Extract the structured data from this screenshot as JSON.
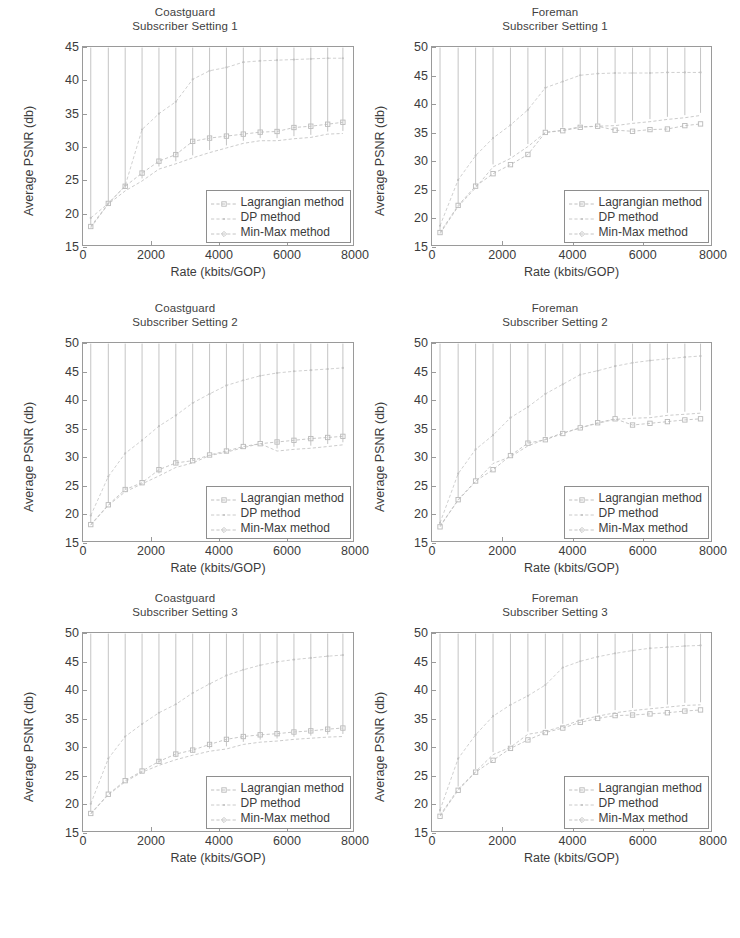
{
  "figure": {
    "background": "#ffffff",
    "series_colors": [
      "#b9b9b9",
      "#c4c4c4",
      "#bdbdbd"
    ],
    "axis_color": "#9a9a9a",
    "text_color": "#3c3c3c"
  },
  "axis": {
    "xlabel": "Rate (kbits/GOP)",
    "ylabel": "Average PSNR (db)",
    "xticks": [
      "0",
      "2000",
      "4000",
      "6000",
      "8000"
    ],
    "xtick_values": [
      0,
      2000,
      4000,
      6000,
      8000
    ],
    "xlim": [
      0,
      8000
    ],
    "yticks_45": [
      "15",
      "20",
      "25",
      "30",
      "35",
      "40",
      "45"
    ],
    "ytick_values_45": [
      15,
      20,
      25,
      30,
      35,
      40,
      45
    ],
    "ylim_45": [
      15,
      45
    ],
    "yticks_50": [
      "15",
      "20",
      "25",
      "30",
      "35",
      "40",
      "45",
      "50"
    ],
    "ytick_values_50": [
      15,
      20,
      25,
      30,
      35,
      40,
      45,
      50
    ],
    "ylim_50": [
      15,
      50
    ]
  },
  "legend": {
    "entries": [
      {
        "label": "Lagrangian method",
        "marker": "square-marker"
      },
      {
        "label": "DP method",
        "marker": "dot-marker"
      },
      {
        "label": "Min-Max method",
        "marker": "diamond-marker"
      }
    ]
  },
  "chart_data": [
    {
      "id": "coastguard-setting-1",
      "type": "line",
      "title": "Coastguard\nSubscriber Setting 1",
      "title_line1": "Coastguard",
      "title_line2": "Subscriber Setting 1",
      "xlabel": "Rate (kbits/GOP)",
      "ylabel": "Average PSNR (db)",
      "xlim": [
        0,
        8000
      ],
      "ylim": [
        15,
        45
      ],
      "grid": false,
      "legend_position": "lower-right",
      "x": [
        230,
        750,
        1250,
        1750,
        2250,
        2750,
        3250,
        3750,
        4250,
        4750,
        5250,
        5750,
        6250,
        6750,
        7250,
        7700
      ],
      "series": [
        {
          "name": "Lagrangian method",
          "values": [
            17.8,
            21.3,
            23.9,
            25.9,
            27.7,
            28.7,
            30.7,
            31.2,
            31.5,
            31.8,
            32.1,
            32.2,
            32.8,
            33.0,
            33.3,
            33.6
          ]
        },
        {
          "name": "DP method",
          "values": [
            19.1,
            21.3,
            24.0,
            32.5,
            34.9,
            36.7,
            40.1,
            41.4,
            41.9,
            42.7,
            42.9,
            43.0,
            43.1,
            43.2,
            43.3,
            43.3
          ]
        },
        {
          "name": "Min-Max method",
          "values": [
            17.6,
            21.2,
            23.2,
            24.7,
            26.5,
            27.3,
            28.2,
            29.0,
            29.7,
            30.4,
            30.8,
            30.8,
            31.1,
            31.3,
            31.8,
            31.9
          ]
        }
      ]
    },
    {
      "id": "foreman-setting-1",
      "type": "line",
      "title": "Foreman\nSubscriber Setting 1",
      "title_line1": "Foreman",
      "title_line2": "Subscriber Setting 1",
      "xlabel": "Rate (kbits/GOP)",
      "ylabel": "Average PSNR (db)",
      "xlim": [
        0,
        8000
      ],
      "ylim": [
        15,
        50
      ],
      "grid": false,
      "legend_position": "lower-right",
      "x": [
        230,
        750,
        1250,
        1750,
        2250,
        2750,
        3250,
        3750,
        4250,
        4750,
        5250,
        5750,
        6250,
        6750,
        7250,
        7700
      ],
      "series": [
        {
          "name": "Lagrangian method",
          "values": [
            17.2,
            22.0,
            25.4,
            27.6,
            29.2,
            31.0,
            34.9,
            35.2,
            35.8,
            36.0,
            35.3,
            35.1,
            35.4,
            35.5,
            36.1,
            36.4
          ]
        },
        {
          "name": "DP method",
          "values": [
            18.4,
            26.5,
            30.8,
            33.9,
            36.2,
            38.9,
            42.8,
            43.9,
            45.0,
            45.3,
            45.4,
            45.4,
            45.4,
            45.5,
            45.5,
            45.5
          ]
        },
        {
          "name": "Min-Max method",
          "values": [
            17.0,
            21.8,
            25.1,
            28.8,
            30.3,
            32.4,
            34.9,
            35.3,
            35.9,
            36.0,
            36.1,
            36.5,
            36.8,
            37.2,
            37.5,
            37.9
          ]
        }
      ]
    },
    {
      "id": "coastguard-setting-2",
      "type": "line",
      "title": "Coastguard\nSubscriber Setting 2",
      "title_line1": "Coastguard",
      "title_line2": "Subscriber Setting 2",
      "xlabel": "Rate (kbits/GOP)",
      "ylabel": "Average PSNR (db)",
      "xlim": [
        0,
        8000
      ],
      "ylim": [
        15,
        50
      ],
      "grid": false,
      "legend_position": "lower-right",
      "x": [
        230,
        750,
        1250,
        1750,
        2250,
        2750,
        3250,
        3750,
        4250,
        4750,
        5250,
        5750,
        6250,
        6750,
        7250,
        7700
      ],
      "series": [
        {
          "name": "Lagrangian method",
          "values": [
            17.9,
            21.4,
            24.1,
            25.3,
            27.6,
            28.8,
            29.2,
            30.2,
            30.9,
            31.7,
            32.2,
            32.5,
            32.8,
            33.1,
            33.3,
            33.5
          ]
        },
        {
          "name": "DP method",
          "values": [
            19.5,
            26.4,
            30.5,
            32.8,
            35.3,
            37.2,
            39.4,
            41.0,
            42.5,
            43.4,
            44.2,
            44.7,
            45.0,
            45.2,
            45.4,
            45.6
          ]
        },
        {
          "name": "Min-Max method",
          "values": [
            17.8,
            21.3,
            23.7,
            25.1,
            26.5,
            28.0,
            28.8,
            30.1,
            30.7,
            31.5,
            32.2,
            30.9,
            31.2,
            31.4,
            31.7,
            32.0
          ]
        }
      ]
    },
    {
      "id": "foreman-setting-2",
      "type": "line",
      "title": "Foreman\nSubscriber Setting 2",
      "title_line1": "Foreman",
      "title_line2": "Subscriber Setting 2",
      "xlabel": "Rate (kbits/GOP)",
      "ylabel": "Average PSNR (db)",
      "xlim": [
        0,
        8000
      ],
      "ylim": [
        15,
        50
      ],
      "grid": false,
      "legend_position": "lower-right",
      "x": [
        230,
        750,
        1250,
        1750,
        2250,
        2750,
        3250,
        3750,
        4250,
        4750,
        5250,
        5750,
        6250,
        6750,
        7250,
        7700
      ],
      "series": [
        {
          "name": "Lagrangian method",
          "values": [
            17.5,
            22.3,
            25.6,
            27.6,
            30.1,
            32.3,
            32.9,
            34.0,
            35.0,
            35.9,
            36.6,
            35.5,
            35.8,
            36.1,
            36.4,
            36.6
          ]
        },
        {
          "name": "DP method",
          "values": [
            18.2,
            26.9,
            31.2,
            33.7,
            36.8,
            38.7,
            41.0,
            42.7,
            44.4,
            45.1,
            45.9,
            46.5,
            46.9,
            47.2,
            47.5,
            47.7
          ]
        },
        {
          "name": "Min-Max method",
          "values": [
            17.7,
            22.2,
            25.5,
            28.7,
            29.9,
            31.8,
            33.0,
            34.1,
            35.0,
            35.8,
            36.5,
            36.7,
            36.8,
            37.2,
            37.4,
            37.6
          ]
        }
      ]
    },
    {
      "id": "coastguard-setting-3",
      "type": "line",
      "title": "Coastguard\nSubscriber Setting 3",
      "title_line1": "Coastguard",
      "title_line2": "Subscriber Setting 3",
      "xlabel": "Rate (kbits/GOP)",
      "ylabel": "Average PSNR (db)",
      "xlim": [
        0,
        8000
      ],
      "ylim": [
        15,
        50
      ],
      "grid": false,
      "legend_position": "lower-right",
      "x": [
        230,
        750,
        1250,
        1750,
        2250,
        2750,
        3250,
        3750,
        4250,
        4750,
        5250,
        5750,
        6250,
        6750,
        7250,
        7700
      ],
      "series": [
        {
          "name": "Lagrangian method",
          "values": [
            18.1,
            21.5,
            23.9,
            25.6,
            27.3,
            28.6,
            29.3,
            30.3,
            31.2,
            31.7,
            32.0,
            32.2,
            32.5,
            32.7,
            33.0,
            33.2
          ]
        },
        {
          "name": "DP method",
          "values": [
            19.8,
            27.8,
            31.7,
            33.9,
            35.9,
            37.4,
            39.4,
            41.0,
            42.5,
            43.5,
            44.3,
            44.9,
            45.3,
            45.6,
            45.9,
            46.1
          ]
        },
        {
          "name": "Min-Max method",
          "values": [
            18.0,
            21.4,
            23.7,
            25.4,
            26.6,
            27.6,
            28.4,
            29.1,
            29.5,
            30.3,
            30.7,
            30.9,
            31.2,
            31.4,
            31.6,
            31.7
          ]
        }
      ]
    },
    {
      "id": "foreman-setting-3",
      "type": "line",
      "title": "Foreman\nSubscriber Setting 3",
      "title_line1": "Foreman",
      "title_line2": "Subscriber Setting 3",
      "xlabel": "Rate (kbits/GOP)",
      "ylabel": "Average PSNR (db)",
      "xlim": [
        0,
        8000
      ],
      "ylim": [
        15,
        50
      ],
      "grid": false,
      "legend_position": "lower-right",
      "x": [
        230,
        750,
        1250,
        1750,
        2250,
        2750,
        3250,
        3750,
        4250,
        4750,
        5250,
        5750,
        6250,
        6750,
        7250,
        7700
      ],
      "series": [
        {
          "name": "Lagrangian method",
          "values": [
            17.6,
            22.2,
            25.4,
            27.5,
            29.6,
            31.1,
            32.4,
            33.2,
            34.2,
            34.9,
            35.4,
            35.5,
            35.7,
            35.9,
            36.2,
            36.4
          ]
        },
        {
          "name": "DP method",
          "values": [
            18.7,
            27.8,
            32.0,
            35.3,
            37.3,
            38.9,
            40.8,
            43.9,
            45.0,
            45.8,
            46.4,
            46.9,
            47.3,
            47.5,
            47.7,
            47.8
          ]
        },
        {
          "name": "Min-Max method",
          "values": [
            17.8,
            22.4,
            25.5,
            28.5,
            29.8,
            32.1,
            32.6,
            33.5,
            34.6,
            35.3,
            35.9,
            36.3,
            36.6,
            36.9,
            37.2,
            37.3
          ]
        }
      ]
    }
  ]
}
